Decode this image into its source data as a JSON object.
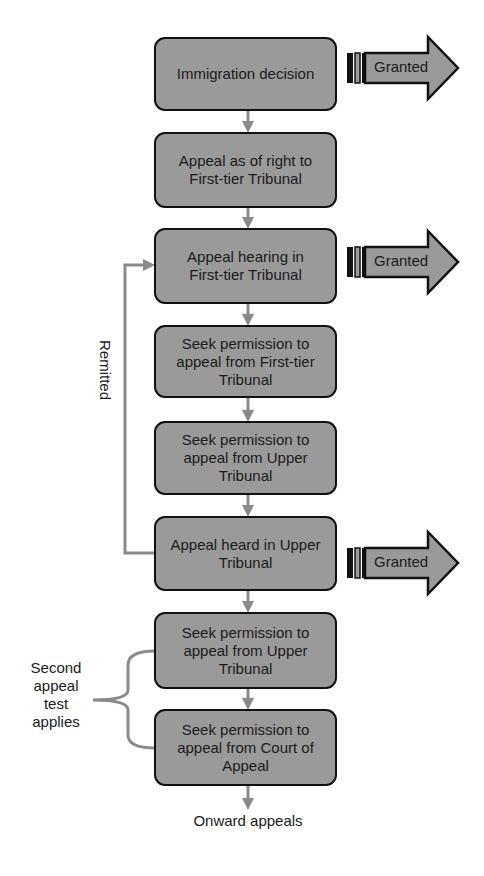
{
  "diagram": {
    "nodes": [
      {
        "id": "immigration-decision",
        "label": "Immigration decision"
      },
      {
        "id": "appeal-as-of-right",
        "label": "Appeal as of right to First-tier Tribunal"
      },
      {
        "id": "appeal-hearing-ftt",
        "label": "Appeal hearing in First-tier Tribunal"
      },
      {
        "id": "permission-from-ftt",
        "label": "Seek permission to appeal from First-tier Tribunal"
      },
      {
        "id": "permission-from-ut-1",
        "label": "Seek permission to appeal from Upper Tribunal"
      },
      {
        "id": "appeal-heard-ut",
        "label": "Appeal heard in Upper Tribunal"
      },
      {
        "id": "permission-from-ut-2",
        "label": "Seek permission to appeal from Upper Tribunal"
      },
      {
        "id": "permission-from-coa",
        "label": "Seek permission to appeal from Court of Appeal"
      }
    ],
    "granted_arrows": [
      {
        "from": "immigration-decision",
        "label": "Granted"
      },
      {
        "from": "appeal-hearing-ftt",
        "label": "Granted"
      },
      {
        "from": "appeal-heard-ut",
        "label": "Granted"
      }
    ],
    "remitted_label": "Remitted",
    "second_appeal_label_lines": [
      "Second",
      "appeal",
      "test",
      "applies"
    ],
    "terminal_label": "Onward appeals",
    "colors": {
      "node_fill": "#9a9a9a",
      "node_border": "#111111",
      "connector": "#8a8a8a",
      "granted_fill": "#9a9a9a"
    }
  }
}
